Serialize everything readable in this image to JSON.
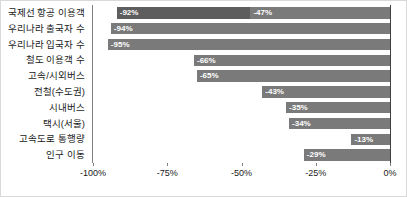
{
  "chart_data": {
    "type": "bar",
    "orientation": "horizontal",
    "title": "",
    "subtitle": "",
    "xlabel": "",
    "ylabel": "",
    "xlim": [
      -100,
      0
    ],
    "grid": false,
    "legend": "none",
    "axis_tick_labels": [
      "-100%",
      "-75%",
      "-50%",
      "-25%",
      "0%"
    ],
    "axis_tick_values": [
      -100,
      -75,
      -50,
      -25,
      0
    ],
    "categories": [
      "국제선 항공 이용객",
      "우리나라 출국자 수",
      "우리나라 입국자 수",
      "철도 이용객 수",
      "고속/시외버스",
      "전철(수도권)",
      "시내버스",
      "택시(서울)",
      "고속도로 통행량",
      "인구 이동"
    ],
    "values": [
      -92,
      -94,
      -95,
      -66,
      -65,
      -43,
      -35,
      -34,
      -13,
      -29
    ],
    "data_labels": [
      "-92%",
      "-94%",
      "-95%",
      "-66%",
      "-65%",
      "-43%",
      "-35%",
      "-34%",
      "-13%",
      "-29%"
    ],
    "secondary_marker": {
      "category_index": 0,
      "value": -47,
      "label": "-47%",
      "note": "두 번째 구간 경계 표시"
    },
    "colors": {
      "bar": "#7a7a7a",
      "bar_dark_segment": "#5e5e5e",
      "data_label_text": "#ffffff",
      "axis_line": "#808080",
      "zero_line": "#404040",
      "text": "#1a1a1a",
      "background": "#ffffff",
      "border": "#d9d9d9"
    }
  }
}
